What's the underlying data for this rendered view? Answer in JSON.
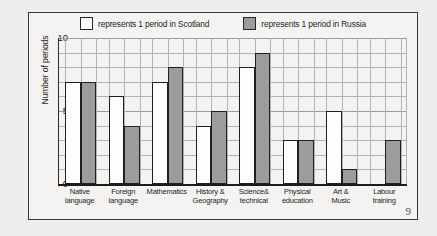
{
  "page": {
    "number": "9"
  },
  "legend": {
    "entries": [
      {
        "key": "scotland",
        "label": "represents 1 period in Scotland",
        "swatch": "white-square-icon",
        "color": "#fbfbfa"
      },
      {
        "key": "russia",
        "label": "represents 1 period in Russia",
        "swatch": "gray-square-icon",
        "color": "#9c9c9c"
      }
    ]
  },
  "axes": {
    "ylabel": "Number of periods",
    "yticks": [
      "0",
      "5",
      "10"
    ]
  },
  "chart_data": {
    "type": "bar",
    "title": "",
    "xlabel": "",
    "ylabel": "Number of periods",
    "ylim": [
      0,
      10
    ],
    "yticks": [
      0,
      5,
      10
    ],
    "grid": true,
    "legend_position": "top",
    "categories": [
      "Native language",
      "Foreign language",
      "Mathematics",
      "History & Geography",
      "Science& technical",
      "Physical education",
      "Art & Music",
      "Labour training"
    ],
    "category_lines": [
      [
        "Native",
        "language"
      ],
      [
        "Foreign",
        "language"
      ],
      [
        "Mathematics",
        ""
      ],
      [
        "History &",
        "Geography"
      ],
      [
        "Science&",
        "technical"
      ],
      [
        "Physical",
        "education"
      ],
      [
        "Art &",
        "Music"
      ],
      [
        "Labour",
        "training"
      ]
    ],
    "series": [
      {
        "name": "Scotland",
        "color": "#fbfbfa",
        "values": [
          7,
          6,
          7,
          4,
          8,
          3,
          5,
          0
        ]
      },
      {
        "name": "Russia",
        "color": "#9c9c9c",
        "values": [
          7,
          4,
          8,
          5,
          9,
          3,
          1,
          3
        ]
      }
    ]
  }
}
